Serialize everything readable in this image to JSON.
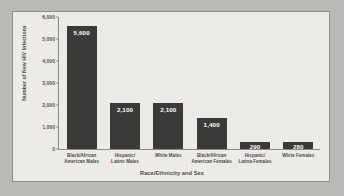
{
  "chart_data": {
    "type": "bar",
    "title": "",
    "xlabel": "Race/Ethnicity and Sex",
    "ylabel": "Number of New HIV Infections",
    "categories": [
      "Black/African American Males",
      "Hispanic/ Latino Males",
      "White Males",
      "Black/African American Females",
      "Hispanic/ Latina Females",
      "White Females"
    ],
    "category_lines": [
      [
        "Black/African",
        "American Males"
      ],
      [
        "Hispanic/",
        "Latino Males"
      ],
      [
        "White Males"
      ],
      [
        "Black/African",
        "American Females"
      ],
      [
        "Hispanic/",
        "Latina Females"
      ],
      [
        "White Females"
      ]
    ],
    "values": [
      5600,
      2100,
      2100,
      1400,
      290,
      280
    ],
    "value_labels": [
      "5,600",
      "2,100",
      "2,100",
      "1,400",
      "290",
      "280"
    ],
    "ylim": [
      0,
      6000
    ],
    "ytick_values": [
      6000,
      5000,
      4000,
      3000,
      2000,
      1000,
      0
    ],
    "ytick_labels": [
      "6,000",
      "5,000",
      "4,000",
      "3,000",
      "2,000",
      "1,000",
      "0"
    ],
    "grid": false,
    "legend": null,
    "bar_color": "#3a3a38",
    "panel_color": "#ecebe8",
    "figure_color": "#b9b9b5",
    "axis_color": "#8a8a86",
    "text_color": "#4a4a46",
    "value_label_color": "#ffffff"
  }
}
